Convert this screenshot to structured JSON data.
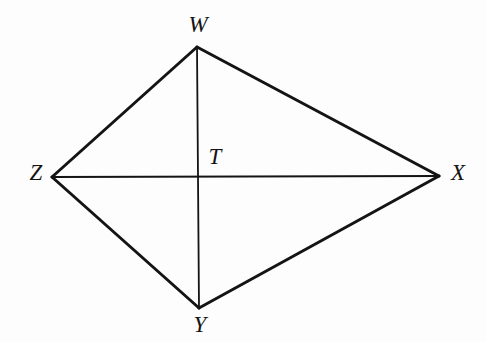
{
  "figure": {
    "kind": "quadrilateral-with-diagonals",
    "background_color": "#fdfdfd",
    "stroke_color": "#141414",
    "outer_edge_width": 3,
    "diagonal_width": 1.8,
    "width": 486,
    "height": 342,
    "vertices": [
      {
        "id": "W",
        "label": "W",
        "x": 197,
        "y": 47,
        "label_x": 198,
        "label_y": 24
      },
      {
        "id": "X",
        "label": "X",
        "x": 439,
        "y": 176,
        "label_x": 458,
        "label_y": 172
      },
      {
        "id": "Y",
        "label": "Y",
        "x": 199,
        "y": 308,
        "label_x": 200,
        "label_y": 324
      },
      {
        "id": "Z",
        "label": "Z",
        "x": 52,
        "y": 177,
        "label_x": 36,
        "label_y": 172
      },
      {
        "id": "T",
        "label": "T",
        "x": 198,
        "y": 177,
        "label_x": 215,
        "label_y": 156
      }
    ],
    "edges": [
      {
        "id": "ZW",
        "from": "Z",
        "to": "W",
        "type": "side"
      },
      {
        "id": "WX",
        "from": "W",
        "to": "X",
        "type": "side"
      },
      {
        "id": "XY",
        "from": "X",
        "to": "Y",
        "type": "side"
      },
      {
        "id": "YZ",
        "from": "Y",
        "to": "Z",
        "type": "side"
      },
      {
        "id": "ZX",
        "from": "Z",
        "to": "X",
        "type": "diagonal"
      },
      {
        "id": "WY",
        "from": "W",
        "to": "Y",
        "type": "diagonal"
      }
    ]
  }
}
